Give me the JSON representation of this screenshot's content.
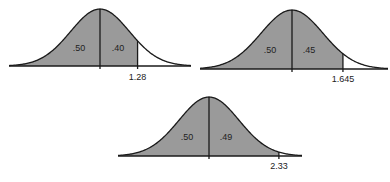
{
  "chart_data": [
    {
      "type": "area",
      "title": "",
      "distribution": "standard normal",
      "shaded_region": "z <= 1.28",
      "areas": [
        {
          "label": ".50",
          "region": "left of mean"
        },
        {
          "label": ".40",
          "region": "mean to 1.28"
        }
      ],
      "cutoff_label": "1.28",
      "cutoff_z": 1.28
    },
    {
      "type": "area",
      "title": "",
      "distribution": "standard normal",
      "shaded_region": "z <= 1.645",
      "areas": [
        {
          "label": ".50",
          "region": "left of mean"
        },
        {
          "label": ".45",
          "region": "mean to 1.645"
        }
      ],
      "cutoff_label": "1.645",
      "cutoff_z": 1.645
    },
    {
      "type": "area",
      "title": "",
      "distribution": "standard normal",
      "shaded_region": "z <= 2.33",
      "areas": [
        {
          "label": ".50",
          "region": "left of mean"
        },
        {
          "label": ".49",
          "region": "mean to 2.33"
        }
      ],
      "cutoff_label": "2.33",
      "cutoff_z": 2.33
    }
  ],
  "colors": {
    "shade": "#9a9a9a",
    "line": "#1a1a1a",
    "background": "#ffffff"
  }
}
